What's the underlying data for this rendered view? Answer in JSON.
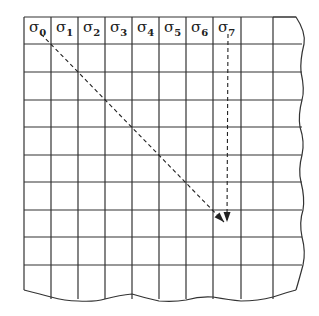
{
  "diagram": {
    "title": "",
    "colors": {
      "line": "#333333",
      "arrow": "#222222",
      "background": "#ffffff"
    },
    "grid": {
      "columns": 10,
      "rows": 10,
      "col_x": [
        24,
        51,
        78,
        105,
        132,
        159,
        186,
        213,
        241,
        273
      ],
      "row_y": [
        17,
        44,
        72,
        100,
        127,
        155,
        182,
        210,
        237,
        265
      ]
    },
    "header_labels": [
      {
        "symbol": "σ",
        "index": "0"
      },
      {
        "symbol": "σ",
        "index": "1"
      },
      {
        "symbol": "σ",
        "index": "2"
      },
      {
        "symbol": "σ",
        "index": "3"
      },
      {
        "symbol": "σ",
        "index": "4"
      },
      {
        "symbol": "σ",
        "index": "5"
      },
      {
        "symbol": "σ",
        "index": "6"
      },
      {
        "symbol": "σ",
        "index": "7"
      }
    ],
    "arrows": [
      {
        "name": "diagonal-arrow",
        "from": "σ0",
        "x1": 41,
        "y1": 34,
        "x2": 224,
        "y2": 222,
        "style": "dashed"
      },
      {
        "name": "vertical-arrow",
        "from": "σ7",
        "x1": 228,
        "y1": 34,
        "x2": 227,
        "y2": 222,
        "style": "dashed"
      }
    ]
  }
}
